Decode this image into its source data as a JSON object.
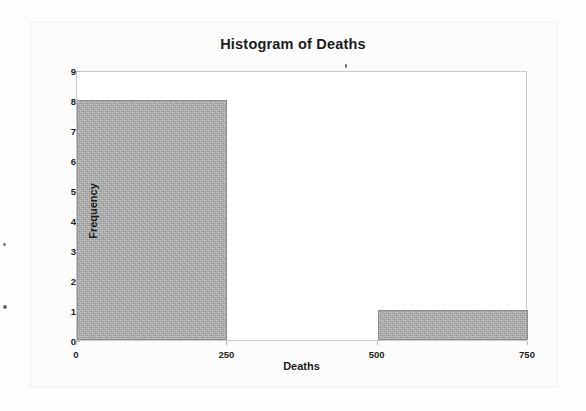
{
  "chart_data": {
    "type": "bar",
    "title": "Histogram of Deaths",
    "xlabel": "Deaths",
    "ylabel": "Frequency",
    "categories": [
      "0-250",
      "250-500",
      "500-750"
    ],
    "bin_edges": [
      0,
      250,
      500,
      750
    ],
    "values": [
      8,
      0,
      1
    ],
    "bins": [
      {
        "label": "0-250",
        "start": 0,
        "end": 250,
        "frequency": 8
      },
      {
        "label": "250-500",
        "start": 250,
        "end": 500,
        "frequency": 0
      },
      {
        "label": "500-750",
        "start": 500,
        "end": 750,
        "frequency": 1
      }
    ],
    "xlim": [
      0,
      750
    ],
    "ylim": [
      0,
      9
    ],
    "x_ticks": [
      "0",
      "250",
      "500",
      "750"
    ],
    "x_tick_values": [
      0,
      250,
      500,
      750
    ],
    "y_ticks": [
      "0",
      "1",
      "2",
      "3",
      "4",
      "5",
      "6",
      "7",
      "8",
      "9"
    ],
    "y_tick_values": [
      0,
      1,
      2,
      3,
      4,
      5,
      6,
      7,
      8,
      9
    ],
    "grid": false,
    "legend": null,
    "bar_color": "#acacac",
    "bar_border_color": "#8e8e8e",
    "frame_color": "#c9c9c9",
    "plot_background": "#ffffff",
    "text_color": "#1c1c1c"
  },
  "page": {
    "background": "#fdfdfd",
    "sheet_color": "#fcfcfc"
  }
}
